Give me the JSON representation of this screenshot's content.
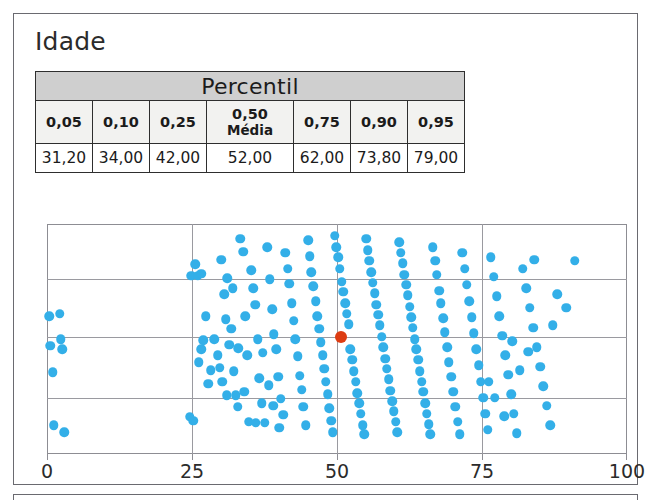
{
  "page": {
    "title": "Idade"
  },
  "table": {
    "header_span": "Percentil",
    "columns": [
      {
        "label": "0,05",
        "sub": ""
      },
      {
        "label": "0,10",
        "sub": ""
      },
      {
        "label": "0,25",
        "sub": ""
      },
      {
        "label": "0,50",
        "sub": "Média"
      },
      {
        "label": "0,75",
        "sub": ""
      },
      {
        "label": "0,90",
        "sub": ""
      },
      {
        "label": "0,95",
        "sub": ""
      }
    ],
    "values": [
      "31,20",
      "34,00",
      "42,00",
      "52,00",
      "62,00",
      "73,80",
      "79,00"
    ]
  },
  "colors": {
    "point": "#33afe8",
    "median_point": "#dd3c12",
    "grid": "#9a9aa0",
    "frame": "#8d8d93",
    "header_fill": "#cfcfcf"
  },
  "chart_data": {
    "type": "scatter",
    "title": "Idade",
    "xlabel": "",
    "ylabel": "",
    "xlim": [
      0,
      100
    ],
    "ylim": [
      0,
      1
    ],
    "grid": true,
    "legend": null,
    "xticks": [
      0,
      25,
      50,
      75,
      100
    ],
    "xtick_labels": [
      "0",
      "25",
      "50",
      "75",
      "100"
    ],
    "ygridlines": [
      0.245,
      0.51,
      0.76
    ],
    "median_marker": {
      "x": 50.7,
      "y": 0.51,
      "color": "#dd3c12",
      "label": "Média 52,00"
    },
    "points": [
      [
        0.4,
        0.6
      ],
      [
        0.6,
        0.47
      ],
      [
        1.0,
        0.355
      ],
      [
        1.2,
        0.125
      ],
      [
        2.2,
        0.61
      ],
      [
        2.4,
        0.5
      ],
      [
        2.6,
        0.455
      ],
      [
        3.0,
        0.095
      ],
      [
        25.2,
        0.145
      ],
      [
        25.6,
        0.825
      ],
      [
        26.2,
        0.4
      ],
      [
        26.6,
        0.455
      ],
      [
        26.9,
        0.495
      ],
      [
        27.4,
        0.6
      ],
      [
        27.8,
        0.305
      ],
      [
        28.2,
        0.365
      ],
      [
        24.9,
        0.775
      ],
      [
        26.0,
        0.775
      ],
      [
        26.6,
        0.783
      ],
      [
        24.6,
        0.162
      ],
      [
        30.0,
        0.845
      ],
      [
        30.6,
        0.695
      ],
      [
        31.1,
        0.765
      ],
      [
        31.4,
        0.475
      ],
      [
        31.8,
        0.545
      ],
      [
        32.2,
        0.36
      ],
      [
        32.5,
        0.255
      ],
      [
        32.9,
        0.205
      ],
      [
        33.3,
        0.935
      ],
      [
        33.8,
        0.88
      ],
      [
        34.2,
        0.6
      ],
      [
        34.5,
        0.43
      ],
      [
        34.8,
        0.14
      ],
      [
        35.2,
        0.8
      ],
      [
        35.6,
        0.72
      ],
      [
        35.9,
        0.65
      ],
      [
        36.3,
        0.5
      ],
      [
        36.6,
        0.33
      ],
      [
        37.0,
        0.22
      ],
      [
        37.5,
        0.135
      ],
      [
        38.0,
        0.9
      ],
      [
        38.4,
        0.76
      ],
      [
        38.8,
        0.63
      ],
      [
        39.1,
        0.52
      ],
      [
        39.5,
        0.455
      ],
      [
        39.9,
        0.335
      ],
      [
        40.3,
        0.24
      ],
      [
        40.7,
        0.17
      ],
      [
        41.1,
        0.875
      ],
      [
        41.5,
        0.805
      ],
      [
        41.8,
        0.74
      ],
      [
        42.2,
        0.655
      ],
      [
        42.5,
        0.58
      ],
      [
        42.8,
        0.5
      ],
      [
        43.2,
        0.425
      ],
      [
        43.6,
        0.34
      ],
      [
        43.9,
        0.28
      ],
      [
        44.2,
        0.205
      ],
      [
        44.6,
        0.125
      ],
      [
        45.0,
        0.93
      ],
      [
        45.3,
        0.86
      ],
      [
        45.6,
        0.79
      ],
      [
        45.9,
        0.73
      ],
      [
        46.3,
        0.665
      ],
      [
        46.6,
        0.6
      ],
      [
        46.9,
        0.545
      ],
      [
        47.2,
        0.485
      ],
      [
        47.5,
        0.43
      ],
      [
        47.8,
        0.37
      ],
      [
        48.1,
        0.315
      ],
      [
        48.4,
        0.26
      ],
      [
        48.7,
        0.2
      ],
      [
        49.0,
        0.145
      ],
      [
        49.3,
        0.095
      ],
      [
        49.6,
        0.95
      ],
      [
        49.9,
        0.9
      ],
      [
        50.2,
        0.855
      ],
      [
        50.5,
        0.805
      ],
      [
        50.8,
        0.75
      ],
      [
        51.1,
        0.705
      ],
      [
        51.4,
        0.655
      ],
      [
        51.7,
        0.61
      ],
      [
        52.0,
        0.565
      ],
      [
        52.3,
        0.455
      ],
      [
        52.6,
        0.41
      ],
      [
        52.9,
        0.36
      ],
      [
        53.2,
        0.315
      ],
      [
        53.5,
        0.265
      ],
      [
        53.8,
        0.22
      ],
      [
        54.1,
        0.175
      ],
      [
        54.4,
        0.125
      ],
      [
        54.7,
        0.085
      ],
      [
        55.0,
        0.935
      ],
      [
        55.3,
        0.885
      ],
      [
        55.6,
        0.84
      ],
      [
        55.9,
        0.79
      ],
      [
        56.2,
        0.745
      ],
      [
        56.5,
        0.7
      ],
      [
        56.8,
        0.65
      ],
      [
        57.1,
        0.605
      ],
      [
        57.4,
        0.56
      ],
      [
        57.7,
        0.51
      ],
      [
        58.0,
        0.465
      ],
      [
        58.3,
        0.415
      ],
      [
        58.6,
        0.37
      ],
      [
        58.9,
        0.325
      ],
      [
        59.2,
        0.275
      ],
      [
        59.5,
        0.23
      ],
      [
        59.8,
        0.185
      ],
      [
        60.1,
        0.14
      ],
      [
        60.4,
        0.095
      ],
      [
        60.7,
        0.92
      ],
      [
        61.0,
        0.875
      ],
      [
        61.3,
        0.83
      ],
      [
        61.6,
        0.78
      ],
      [
        61.9,
        0.735
      ],
      [
        62.2,
        0.69
      ],
      [
        62.5,
        0.64
      ],
      [
        62.8,
        0.595
      ],
      [
        63.1,
        0.55
      ],
      [
        63.4,
        0.5
      ],
      [
        63.7,
        0.455
      ],
      [
        64.0,
        0.41
      ],
      [
        64.3,
        0.36
      ],
      [
        64.6,
        0.315
      ],
      [
        64.9,
        0.27
      ],
      [
        65.2,
        0.22
      ],
      [
        65.5,
        0.175
      ],
      [
        65.8,
        0.13
      ],
      [
        66.1,
        0.085
      ],
      [
        66.5,
        0.9
      ],
      [
        66.9,
        0.84
      ],
      [
        67.2,
        0.78
      ],
      [
        67.6,
        0.71
      ],
      [
        67.9,
        0.655
      ],
      [
        68.3,
        0.59
      ],
      [
        68.6,
        0.53
      ],
      [
        69.0,
        0.465
      ],
      [
        69.3,
        0.4
      ],
      [
        69.7,
        0.335
      ],
      [
        70.0,
        0.27
      ],
      [
        70.4,
        0.205
      ],
      [
        70.8,
        0.14
      ],
      [
        71.2,
        0.085
      ],
      [
        71.6,
        0.875
      ],
      [
        72.0,
        0.805
      ],
      [
        72.4,
        0.735
      ],
      [
        72.8,
        0.665
      ],
      [
        73.2,
        0.595
      ],
      [
        73.6,
        0.525
      ],
      [
        74.0,
        0.455
      ],
      [
        74.4,
        0.385
      ],
      [
        74.8,
        0.315
      ],
      [
        75.2,
        0.245
      ],
      [
        75.6,
        0.175
      ],
      [
        76.0,
        0.105
      ],
      [
        76.5,
        0.855
      ],
      [
        77.0,
        0.77
      ],
      [
        77.5,
        0.685
      ],
      [
        78.0,
        0.6
      ],
      [
        78.5,
        0.515
      ],
      [
        79.0,
        0.43
      ],
      [
        79.5,
        0.345
      ],
      [
        80.0,
        0.26
      ],
      [
        80.5,
        0.175
      ],
      [
        81.0,
        0.09
      ],
      [
        82.0,
        0.805
      ],
      [
        82.6,
        0.72
      ],
      [
        83.2,
        0.635
      ],
      [
        83.8,
        0.55
      ],
      [
        84.4,
        0.465
      ],
      [
        85.0,
        0.38
      ],
      [
        85.6,
        0.295
      ],
      [
        86.2,
        0.21
      ],
      [
        86.8,
        0.125
      ],
      [
        88.0,
        0.695
      ],
      [
        89.5,
        0.635
      ],
      [
        91.0,
        0.84
      ],
      [
        84.0,
        0.845
      ],
      [
        87.2,
        0.56
      ],
      [
        83.0,
        0.445
      ],
      [
        81.5,
        0.365
      ],
      [
        80.2,
        0.49
      ],
      [
        78.8,
        0.165
      ],
      [
        77.2,
        0.245
      ],
      [
        76.2,
        0.315
      ],
      [
        30.8,
        0.585
      ],
      [
        32.0,
        0.72
      ],
      [
        33.0,
        0.46
      ],
      [
        34.0,
        0.27
      ],
      [
        36.0,
        0.135
      ],
      [
        37.2,
        0.44
      ],
      [
        38.2,
        0.3
      ],
      [
        39.0,
        0.21
      ],
      [
        40.0,
        0.115
      ],
      [
        28.8,
        0.5
      ],
      [
        29.4,
        0.43
      ],
      [
        29.8,
        0.375
      ],
      [
        30.2,
        0.315
      ],
      [
        31.0,
        0.255
      ]
    ]
  }
}
